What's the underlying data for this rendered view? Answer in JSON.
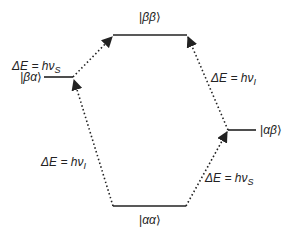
{
  "diagram": {
    "type": "energy-level-diagram",
    "levels": [
      {
        "id": "bb",
        "label": "|ββ⟩",
        "ket_inner": "ββ"
      },
      {
        "id": "ba",
        "label": "|βα⟩",
        "ket_inner": "βα"
      },
      {
        "id": "ab",
        "label": "|αβ⟩",
        "ket_inner": "αβ"
      },
      {
        "id": "aa",
        "label": "|αα⟩",
        "ket_inner": "αα"
      }
    ],
    "transitions": [
      {
        "from": "ba",
        "to": "bb",
        "label_prefix": "ΔE = hν",
        "subscript": "S"
      },
      {
        "from": "ab",
        "to": "bb",
        "label_prefix": "ΔE = hν",
        "subscript": "I"
      },
      {
        "from": "aa",
        "to": "ba",
        "label_prefix": "ΔE = hν",
        "subscript": "I"
      },
      {
        "from": "aa",
        "to": "ab",
        "label_prefix": "ΔE = hν",
        "subscript": "S"
      }
    ],
    "colors": {
      "line": "#222222",
      "background": "#ffffff"
    }
  }
}
